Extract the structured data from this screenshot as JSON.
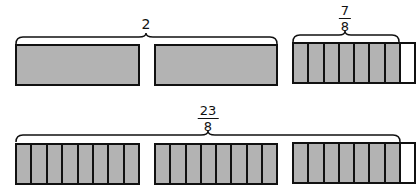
{
  "figure": {
    "top_row": {
      "whole_label": "2",
      "fraction_label": {
        "numerator": "7",
        "denominator": "8"
      },
      "bars": [
        {
          "type": "whole",
          "shaded": true
        },
        {
          "type": "whole",
          "shaded": true
        },
        {
          "type": "eighths",
          "parts": 8,
          "shaded_parts": 7
        }
      ]
    },
    "bottom_row": {
      "fraction_label": {
        "numerator": "23",
        "denominator": "8"
      },
      "bars": [
        {
          "type": "eighths",
          "parts": 8,
          "shaded_parts": 8
        },
        {
          "type": "eighths",
          "parts": 8,
          "shaded_parts": 8
        },
        {
          "type": "eighths",
          "parts": 8,
          "shaded_parts": 7
        }
      ]
    },
    "colors": {
      "shade": "#b3b3b3",
      "outline": "#111111",
      "background": "#ffffff"
    }
  }
}
